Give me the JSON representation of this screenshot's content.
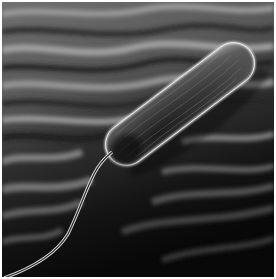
{
  "image": {
    "description": "Grayscale scanning-electron-micrograph style image of a rod-shaped bacterium with a single flagellum resting above a textured fibrous surface",
    "subject": "rod-shaped bacterium (bacillus)",
    "features": [
      "bacterium-body",
      "flagellum",
      "textured-surface"
    ],
    "palette": {
      "surface_light": "#9a9a9a",
      "surface_mid": "#5a5a5a",
      "surface_dark": "#0c0c0c",
      "body_fill": "#3c3c3c",
      "body_rim": "#e8e8e8",
      "border": "#ffffff"
    }
  }
}
